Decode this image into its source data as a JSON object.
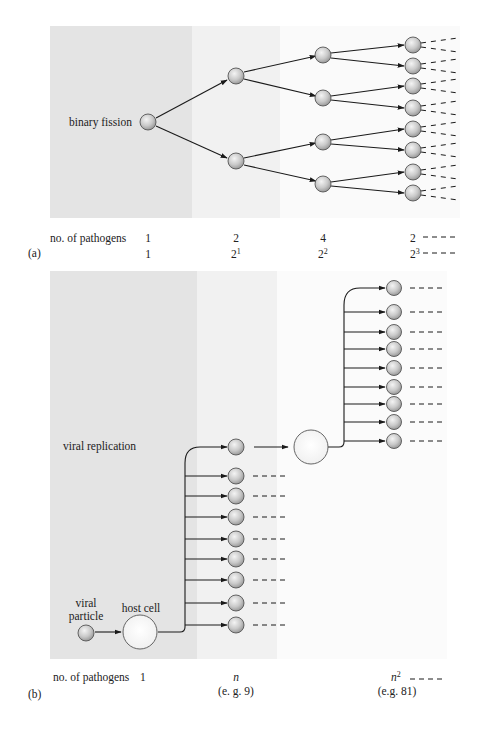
{
  "panel_a": {
    "letter": "(a)",
    "process_label": "binary fission",
    "row_label": "no. of pathogens",
    "generations": [
      {
        "count": "1",
        "power_base": "1",
        "power_exp": ""
      },
      {
        "count": "2",
        "power_base": "2",
        "power_exp": "1"
      },
      {
        "count": "4",
        "power_base": "2",
        "power_exp": "2"
      },
      {
        "count": "8 - - - -",
        "power_base": "2",
        "power_exp": "3",
        "power_tail": "- - - -"
      }
    ],
    "band_colors": [
      "#e4e4e4",
      "#f1f1f1",
      "#fafafa"
    ]
  },
  "panel_b": {
    "letter": "(b)",
    "process_label": "viral replication",
    "particle_label_line1": "viral",
    "particle_label_line2": "particle",
    "host_label": "host cell",
    "row_label": "no. of pathogens",
    "generations": [
      {
        "count": "1",
        "example": ""
      },
      {
        "count": "n",
        "example": "(e. g. 9)"
      },
      {
        "count": "n",
        "count_exp": "2",
        "tail": "- - - ·",
        "example": "(e.g. 81)"
      }
    ],
    "band_colors": [
      "#e4e4e4",
      "#f1f1f1",
      "#fbfbfb"
    ]
  },
  "colors": {
    "line": "#1a1a1a",
    "pathogen_fill": "#c8c8c8",
    "pathogen_stroke": "#555555",
    "host_fill": "#ffffff"
  }
}
